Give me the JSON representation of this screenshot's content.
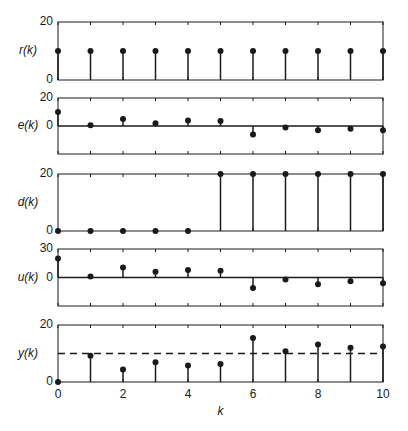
{
  "chart_data": [
    {
      "type": "stem",
      "ylabel": "r(k)",
      "x": [
        0,
        1,
        2,
        3,
        4,
        5,
        6,
        7,
        8,
        9,
        10
      ],
      "values": [
        10,
        10,
        10,
        10,
        10,
        10,
        10,
        10,
        10,
        10,
        10
      ],
      "ylim": [
        0,
        20
      ],
      "yticks": [
        "0",
        "20"
      ]
    },
    {
      "type": "stem",
      "ylabel": "e(k)",
      "x": [
        0,
        1,
        2,
        3,
        4,
        5,
        6,
        7,
        8,
        9,
        10
      ],
      "values": [
        10,
        0.5,
        5,
        2,
        4,
        3.5,
        -6,
        -1,
        -3,
        -2,
        -3
      ],
      "ylim": [
        -20,
        20
      ],
      "yticks": [
        "0",
        "20"
      ],
      "zero_line": true
    },
    {
      "type": "stem",
      "ylabel": "d(k)",
      "x": [
        0,
        1,
        2,
        3,
        4,
        5,
        6,
        7,
        8,
        9,
        10
      ],
      "values": [
        0,
        0,
        0,
        0,
        0,
        20,
        20,
        20,
        20,
        20,
        20
      ],
      "ylim": [
        0,
        20
      ],
      "yticks": [
        "0",
        "20"
      ]
    },
    {
      "type": "stem",
      "ylabel": "u(k)",
      "x": [
        0,
        1,
        2,
        3,
        4,
        5,
        6,
        7,
        8,
        9,
        10
      ],
      "values": [
        20,
        1,
        10.5,
        6,
        8,
        7,
        -11,
        -2,
        -7,
        -4,
        -6
      ],
      "ylim": [
        -30,
        30
      ],
      "yticks": [
        "0",
        "30"
      ],
      "zero_line": true
    },
    {
      "type": "stem",
      "ylabel": "y(k)",
      "xlabel": "k",
      "x": [
        0,
        1,
        2,
        3,
        4,
        5,
        6,
        7,
        8,
        9,
        10
      ],
      "values": [
        0,
        9.2,
        4.4,
        6.9,
        5.8,
        6.3,
        15.4,
        10.8,
        13.2,
        12.0,
        12.5
      ],
      "ylim": [
        0,
        20
      ],
      "yticks": [
        "0",
        "20"
      ],
      "reference_line": {
        "value": 10,
        "style": "dashed"
      },
      "xticks": [
        "0",
        "2",
        "4",
        "6",
        "8",
        "10"
      ]
    }
  ],
  "figure": {
    "xlabel": "k",
    "xlim": [
      0,
      10
    ],
    "panel_labels": [
      "r(k)",
      "e(k)",
      "d(k)",
      "u(k)",
      "y(k)"
    ],
    "colors": {
      "ink": "#1a1a1a",
      "background": "#ffffff"
    }
  }
}
